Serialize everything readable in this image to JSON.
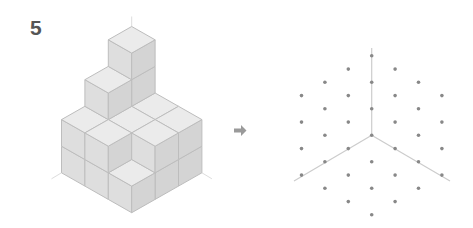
{
  "problem": {
    "number": "5"
  },
  "colors": {
    "top_face": "#ebebeb",
    "left_face": "#dedede",
    "right_face": "#d4d4d4",
    "cube_edge": "#bdbdbd",
    "axis_guide": "#dddddd",
    "arrow": "#9a9a9a",
    "grid_dot": "#888888",
    "grid_line": "#cccccc"
  },
  "cube_structure": {
    "description": "Isometric stack of unit cubes on a 3x3 footprint",
    "origin": [
      131.7,
      212.7
    ],
    "unit_x": [
      23.4,
      -13.3
    ],
    "unit_y": [
      -23.4,
      -13.3
    ],
    "unit_z": [
      0,
      -26.6
    ],
    "heights": [
      [
        1,
        2,
        2
      ],
      [
        2,
        2,
        3
      ],
      [
        2,
        2,
        4
      ]
    ],
    "heights_note": "heights[i][j], i along right axis, j along left axis, [0][0] is the front corner"
  },
  "arrow": {
    "direction": "right",
    "points": [
      [
        234,
        128.5
      ],
      [
        241,
        128.5
      ],
      [
        241,
        125
      ],
      [
        246.5,
        130.5
      ],
      [
        241,
        136
      ],
      [
        241,
        132.5
      ],
      [
        234,
        132.5
      ]
    ]
  },
  "isometric_dot_grid": {
    "center": [
      371.7,
      135.3
    ],
    "step_x": 23.4,
    "step_y": 26.5,
    "radius": 3,
    "axis_lines": [
      {
        "from": [
          371.7,
          135.3
        ],
        "to": [
          371.7,
          48
        ]
      },
      {
        "from": [
          371.7,
          135.3
        ],
        "to": [
          294,
          181
        ]
      },
      {
        "from": [
          371.7,
          135.3
        ],
        "to": [
          450,
          181
        ]
      }
    ]
  }
}
